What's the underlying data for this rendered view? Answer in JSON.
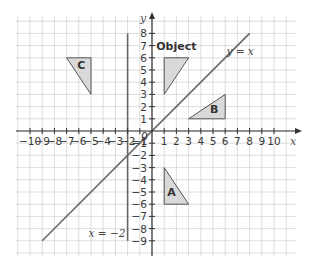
{
  "diagram": {
    "type": "coordinate-grid-reflections",
    "x_axis": {
      "label": "x",
      "ticks": [
        -10,
        -9,
        -8,
        -7,
        -6,
        -5,
        -4,
        -3,
        -2,
        -1,
        1,
        2,
        3,
        4,
        5,
        6,
        7,
        8,
        9,
        10
      ],
      "zero_label": "0"
    },
    "y_axis": {
      "label": "y",
      "ticks": [
        8,
        7,
        6,
        5,
        4,
        3,
        2,
        1,
        -1,
        -2,
        -3,
        -4,
        -5,
        -6,
        -7,
        -8,
        -9
      ]
    },
    "lines": [
      {
        "name": "y-equals-x",
        "label": "y = x",
        "from": [
          -9,
          -9
        ],
        "to": [
          8,
          8
        ]
      },
      {
        "name": "x-equals-minus-2",
        "label": "x = −2",
        "from": [
          -2,
          -9
        ],
        "to": [
          -2,
          8
        ]
      }
    ],
    "shapes": [
      {
        "name": "object",
        "label": "Object",
        "vertices": [
          [
            1,
            6
          ],
          [
            3,
            6
          ],
          [
            1,
            3
          ]
        ],
        "fill": "#d9d9d9"
      },
      {
        "name": "B",
        "label": "B",
        "vertices": [
          [
            6,
            3
          ],
          [
            6,
            1
          ],
          [
            3,
            1
          ]
        ],
        "fill": "#d9d9d9"
      },
      {
        "name": "A",
        "label": "A",
        "vertices": [
          [
            1,
            -3
          ],
          [
            1,
            -6
          ],
          [
            3,
            -6
          ]
        ],
        "fill": "#d9d9d9"
      },
      {
        "name": "C",
        "label": "C",
        "vertices": [
          [
            -7,
            6
          ],
          [
            -5,
            6
          ],
          [
            -5,
            3
          ]
        ],
        "fill": "#d9d9d9"
      }
    ],
    "colors": {
      "grid": "#d4d4d4",
      "axis": "#333333",
      "line": "#666666",
      "shape_fill": "#d9d9d9",
      "shape_stroke": "#555555"
    }
  }
}
